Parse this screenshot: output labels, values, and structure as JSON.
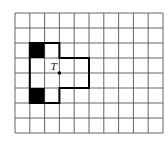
{
  "diagram": {
    "type": "grid-figure",
    "grid": {
      "columns": 10,
      "rows": 8,
      "origin_x": 15,
      "origin_y": 13,
      "cell_w": 14.8,
      "cell_h": 15,
      "line_color": "#555555"
    },
    "shape": {
      "outline_cells_path": [
        [
          1,
          2
        ],
        [
          3,
          2
        ],
        [
          3,
          3
        ],
        [
          5,
          3
        ],
        [
          5,
          5
        ],
        [
          3,
          5
        ],
        [
          3,
          6
        ],
        [
          1,
          6
        ]
      ],
      "stroke_color": "#000000"
    },
    "shaded_cells": [
      {
        "col": 1,
        "row": 2,
        "color": "#000000"
      },
      {
        "col": 1,
        "row": 5,
        "color": "#000000"
      }
    ],
    "point": {
      "label": "T",
      "col": 3,
      "row": 4
    }
  }
}
